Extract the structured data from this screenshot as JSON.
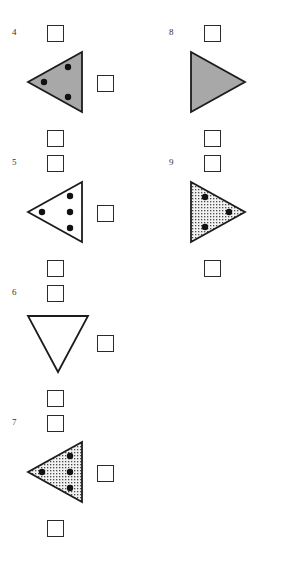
{
  "page": {
    "width": 307,
    "height": 565,
    "background": "#ffffff"
  },
  "colors": {
    "outline": "#1c1c1c",
    "gray_fill": "#a8a8a8",
    "stipple_fill": "#f2f2f2",
    "stipple_dot": "#4a4a4a",
    "white_fill": "#ffffff",
    "dot": "#111111",
    "box_border": "#2b2b2b",
    "number_text": "#333333"
  },
  "items": [
    {
      "number": "4",
      "column": "left",
      "row": 0,
      "shape": {
        "name": "triangle-left-gray-3dots",
        "orientation": "left",
        "fill": "gray",
        "dot_count": 3,
        "dots": [
          {
            "x": 18,
            "y": 32
          },
          {
            "x": 42,
            "y": 17
          },
          {
            "x": 42,
            "y": 47
          }
        ]
      },
      "boxes": [
        "top",
        "right",
        "bottom"
      ]
    },
    {
      "number": "5",
      "column": "left",
      "row": 1,
      "shape": {
        "name": "triangle-left-white-4dots",
        "orientation": "left",
        "fill": "white",
        "dot_count": 4,
        "dots": [
          {
            "x": 16,
            "y": 32
          },
          {
            "x": 44,
            "y": 16
          },
          {
            "x": 44,
            "y": 32
          },
          {
            "x": 44,
            "y": 48
          }
        ]
      },
      "boxes": [
        "top",
        "right",
        "bottom"
      ]
    },
    {
      "number": "6",
      "column": "left",
      "row": 2,
      "shape": {
        "name": "triangle-down-white-0dots",
        "orientation": "down",
        "fill": "white",
        "dot_count": 0,
        "dots": []
      },
      "boxes": [
        "top",
        "right",
        "bottom"
      ]
    },
    {
      "number": "7",
      "column": "left",
      "row": 3,
      "shape": {
        "name": "triangle-left-stipple-4dots",
        "orientation": "left",
        "fill": "stipple",
        "dot_count": 4,
        "dots": [
          {
            "x": 16,
            "y": 32
          },
          {
            "x": 44,
            "y": 16
          },
          {
            "x": 44,
            "y": 32
          },
          {
            "x": 44,
            "y": 48
          }
        ]
      },
      "boxes": [
        "top",
        "right",
        "bottom"
      ]
    },
    {
      "number": "8",
      "column": "right",
      "row": 0,
      "shape": {
        "name": "triangle-right-gray-0dots",
        "orientation": "right",
        "fill": "gray",
        "dot_count": 0,
        "dots": []
      },
      "boxes": [
        "top",
        "bottom"
      ]
    },
    {
      "number": "9",
      "column": "right",
      "row": 1,
      "shape": {
        "name": "triangle-right-stipple-3dots",
        "orientation": "right",
        "fill": "stipple",
        "dot_count": 3,
        "dots": [
          {
            "x": 46,
            "y": 32
          },
          {
            "x": 22,
            "y": 17
          },
          {
            "x": 22,
            "y": 47
          }
        ]
      },
      "boxes": [
        "top",
        "bottom"
      ]
    }
  ]
}
